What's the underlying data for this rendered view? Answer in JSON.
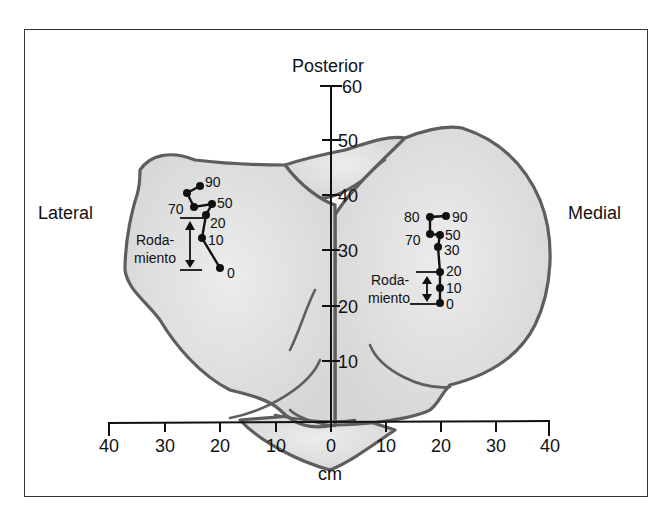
{
  "figure": {
    "labels": {
      "top": "Posterior",
      "left": "Lateral",
      "right": "Medial",
      "x_unit": "cm"
    },
    "y_axis_ticks": [
      "60",
      "50",
      "40",
      "30",
      "20",
      "10"
    ],
    "x_axis_ticks": [
      "40",
      "30",
      "20",
      "10",
      "0",
      "10",
      "20",
      "30",
      "40"
    ],
    "lateral": {
      "points": [
        {
          "label": "90",
          "x": 200,
          "y": 186
        },
        {
          "label": "",
          "x": 187,
          "y": 193
        },
        {
          "label": "70",
          "x": 194,
          "y": 207
        },
        {
          "label": "50",
          "x": 212,
          "y": 204
        },
        {
          "label": "20",
          "x": 206,
          "y": 215
        },
        {
          "label": "10",
          "x": 202,
          "y": 238
        },
        {
          "label": "0",
          "x": 220,
          "y": 268
        }
      ],
      "rolling_label_1": "Roda-",
      "rolling_label_2": "miento"
    },
    "medial": {
      "points": [
        {
          "label": "90",
          "x": 446,
          "y": 216
        },
        {
          "label": "80",
          "x": 430,
          "y": 217
        },
        {
          "label": "70",
          "x": 430,
          "y": 234
        },
        {
          "label": "50",
          "x": 440,
          "y": 235
        },
        {
          "label": "30",
          "x": 438,
          "y": 247
        },
        {
          "label": "20",
          "x": 440,
          "y": 272
        },
        {
          "label": "10",
          "x": 440,
          "y": 288
        },
        {
          "label": "0",
          "x": 440,
          "y": 303
        }
      ],
      "rolling_label_1": "Roda-",
      "rolling_label_2": "miento"
    },
    "colors": {
      "bone_fill": "#dcdcdc",
      "bone_stroke": "#5e5e5e",
      "ink": "#111111"
    }
  }
}
